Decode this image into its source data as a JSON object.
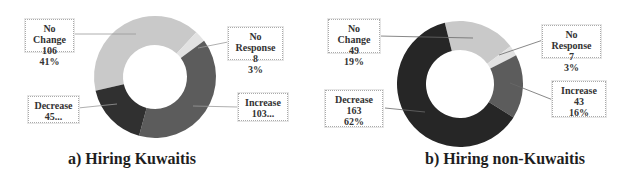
{
  "chart_data": [
    {
      "type": "pie",
      "variant": "donut",
      "title": "a) Hiring Kuwaitis",
      "categories": [
        "No Change",
        "No Response",
        "Increase",
        "Decrease"
      ],
      "values": [
        106,
        8,
        103,
        45
      ],
      "percentages": [
        "41%",
        "3%",
        "",
        ""
      ],
      "labels": [
        {
          "name": "No Change",
          "value": "106",
          "pct": "41%"
        },
        {
          "name": "No Response",
          "value": "8",
          "pct": "3%"
        },
        {
          "name": "Increase",
          "value": "103...",
          "pct": ""
        },
        {
          "name": "Decrease",
          "value": "45...",
          "pct": ""
        }
      ],
      "colors": {
        "No Change": "#c9c9c9",
        "No Response": "#e2e2e2",
        "Increase": "#5c5c5c",
        "Decrease": "#303030"
      }
    },
    {
      "type": "pie",
      "variant": "donut",
      "title": "b) Hiring non-Kuwaitis",
      "categories": [
        "No Change",
        "No Response",
        "Increase",
        "Decrease"
      ],
      "values": [
        49,
        7,
        43,
        163
      ],
      "percentages": [
        "19%",
        "3%",
        "16%",
        "62%"
      ],
      "labels": [
        {
          "name": "No Change",
          "value": "49",
          "pct": "19%"
        },
        {
          "name": "No Response",
          "value": "7",
          "pct": "3%"
        },
        {
          "name": "Increase",
          "value": "43",
          "pct": "16%"
        },
        {
          "name": "Decrease",
          "value": "163",
          "pct": "62%"
        }
      ],
      "colors": {
        "No Change": "#c9c9c9",
        "No Response": "#e2e2e2",
        "Increase": "#5c5c5c",
        "Decrease": "#262626"
      }
    }
  ]
}
